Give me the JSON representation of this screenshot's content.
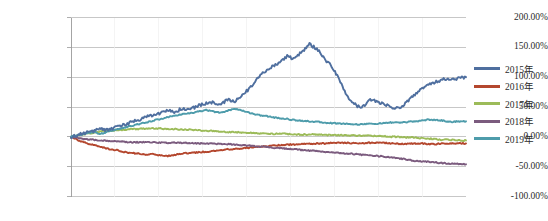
{
  "chart_data": {
    "type": "line",
    "title": "",
    "subtitle": "",
    "xlabel": "",
    "ylabel": "",
    "ylim": [
      -100,
      200
    ],
    "ytick_labels": [
      "200.00%",
      "150.00%",
      "100.00%",
      "50.00%",
      "0.00%",
      "-50.00%",
      "-100.00%"
    ],
    "ytick_values": [
      200,
      150,
      100,
      50,
      0,
      -50,
      -100
    ],
    "xtick_labels": [],
    "grid": "horizontal-and-faint-vertical",
    "legend_position": "right",
    "x_count": 49,
    "colors": {
      "2015": "#4F6F9F",
      "2016": "#B4472E",
      "2017": "#9CBB59",
      "2018": "#7B5B7E",
      "2019": "#4E9CAB"
    },
    "series": [
      {
        "name": "2015年",
        "color": "#4F6F9F",
        "values": [
          0,
          4,
          7,
          10,
          13,
          11,
          16,
          20,
          24,
          28,
          33,
          36,
          40,
          44,
          42,
          48,
          46,
          52,
          56,
          58,
          55,
          62,
          60,
          70,
          82,
          97,
          110,
          118,
          125,
          135,
          130,
          143,
          155,
          148,
          130,
          118,
          95,
          70,
          55,
          48,
          62,
          60,
          55,
          50,
          47,
          58,
          70,
          80,
          88,
          92,
          96,
          95,
          99,
          100
        ]
      },
      {
        "name": "2016年",
        "color": "#B4472E",
        "values": [
          0,
          -6,
          -10,
          -14,
          -17,
          -20,
          -22,
          -25,
          -27,
          -28,
          -30,
          -29,
          -31,
          -32,
          -30,
          -28,
          -27,
          -26,
          -25,
          -24,
          -22,
          -21,
          -20,
          -19,
          -18,
          -17,
          -16,
          -15,
          -14,
          -13,
          -13,
          -12,
          -12,
          -11,
          -11,
          -10,
          -10,
          -10,
          -11,
          -11,
          -10,
          -10,
          -10,
          -11,
          -12,
          -12,
          -11,
          -11,
          -12,
          -12,
          -11,
          -11,
          -11,
          -11
        ]
      },
      {
        "name": "2017年",
        "color": "#9CBB59",
        "values": [
          0,
          3,
          5,
          7,
          9,
          10,
          11,
          12,
          13,
          13,
          14,
          14,
          14,
          13,
          13,
          12,
          12,
          11,
          10,
          10,
          9,
          8,
          8,
          7,
          7,
          6,
          6,
          5,
          5,
          5,
          4,
          4,
          4,
          4,
          3,
          3,
          3,
          3,
          2,
          2,
          2,
          1,
          1,
          0,
          0,
          -1,
          -1,
          -2,
          -3,
          -4,
          -5,
          -5,
          -6,
          -6
        ]
      },
      {
        "name": "2018年",
        "color": "#7B5B7E",
        "values": [
          0,
          -2,
          -4,
          -5,
          -6,
          -7,
          -7,
          -8,
          -9,
          -9,
          -9,
          -9,
          -10,
          -10,
          -10,
          -10,
          -10,
          -11,
          -11,
          -11,
          -12,
          -12,
          -13,
          -14,
          -15,
          -16,
          -17,
          -18,
          -19,
          -20,
          -21,
          -22,
          -23,
          -24,
          -25,
          -26,
          -27,
          -28,
          -29,
          -30,
          -31,
          -32,
          -33,
          -35,
          -36,
          -38,
          -40,
          -41,
          -42,
          -43,
          -44,
          -45,
          -45,
          -46
        ]
      },
      {
        "name": "2019年",
        "color": "#4E9CAB",
        "values": [
          0,
          3,
          6,
          8,
          5,
          9,
          12,
          15,
          18,
          21,
          24,
          27,
          30,
          33,
          36,
          38,
          40,
          42,
          45,
          43,
          40,
          44,
          47,
          44,
          40,
          37,
          35,
          33,
          31,
          30,
          28,
          27,
          26,
          25,
          24,
          23,
          22,
          22,
          21,
          21,
          22,
          22,
          23,
          24,
          24,
          25,
          26,
          27,
          29,
          28,
          27,
          25,
          26,
          26
        ]
      }
    ],
    "legend": [
      {
        "label": "2015年",
        "color": "#4F6F9F"
      },
      {
        "label": "2016年",
        "color": "#B4472E"
      },
      {
        "label": "2017年",
        "color": "#9CBB59"
      },
      {
        "label": "2018年",
        "color": "#7B5B7E"
      },
      {
        "label": "2019年",
        "color": "#4E9CAB"
      }
    ]
  }
}
